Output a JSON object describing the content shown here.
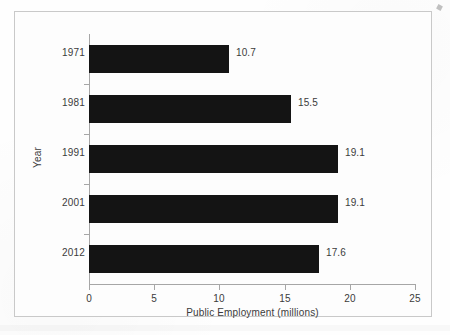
{
  "chart_data": {
    "type": "bar",
    "orientation": "horizontal",
    "title": "",
    "xlabel": "Public Employment (millions)",
    "ylabel": "Year",
    "categories": [
      "1971",
      "1981",
      "1991",
      "2001",
      "2012"
    ],
    "values": [
      10.7,
      15.5,
      19.1,
      19.1,
      17.6
    ],
    "data_labels": [
      "10.7",
      "15.5",
      "19.1",
      "19.1",
      "17.6"
    ],
    "xlim": [
      0,
      25
    ],
    "xticks": [
      0,
      5,
      10,
      15,
      20,
      25
    ],
    "xtick_labels": [
      "0",
      "5",
      "10",
      "15",
      "20",
      "25"
    ],
    "grid": false,
    "legend": null,
    "bar_color": "#141414",
    "text_color": "#3b3b3b",
    "axis_color": "#a6a6a6",
    "frame_color": "#c9c9c9",
    "background": "#fdfdfd"
  }
}
